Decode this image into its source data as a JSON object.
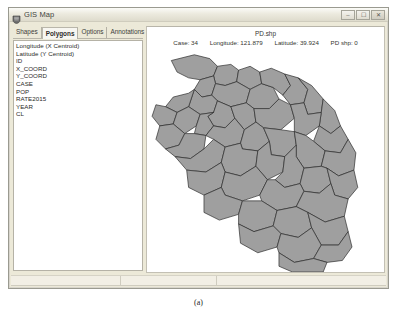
{
  "window": {
    "title": "GIS Map",
    "icon": "gis-app-icon",
    "buttons": [
      {
        "name": "minimize",
        "glyph": "–"
      },
      {
        "name": "maximize",
        "glyph": "☐"
      },
      {
        "name": "close",
        "glyph": "✕"
      }
    ]
  },
  "tabs": [
    {
      "label": "Shapes",
      "active": false
    },
    {
      "label": "Polygons",
      "active": true
    },
    {
      "label": "Options",
      "active": false
    },
    {
      "label": "Annotations",
      "active": false
    }
  ],
  "field_list": {
    "items": [
      "Longitude (X Centroid)",
      "Latitude (Y Centroid)",
      "ID",
      "X_COORD",
      "Y_COORD",
      "CASE",
      "POP",
      "RATE2015",
      "YEAR",
      "CL"
    ]
  },
  "map": {
    "title": "PD.shp",
    "status": {
      "case_label": "Case: 34",
      "longitude_label": "Longitude: 121.879",
      "latitude_label": "Latitude: 39.924",
      "layer_label": "PD shp: 0"
    },
    "fill_color": "#9f9f9f",
    "stroke_color": "#2a2a2a",
    "background_color": "#ffffff"
  },
  "status_bar": {
    "cells": [
      "",
      "",
      ""
    ]
  },
  "caption": "(a)"
}
